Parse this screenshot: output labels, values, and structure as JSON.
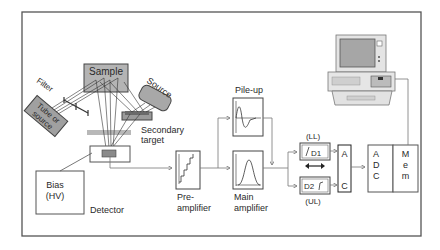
{
  "diagram": {
    "labels": {
      "sample": "Sample",
      "source": "Source",
      "filter": "Filter",
      "tube_line1": "Tube or",
      "tube_line2": "source",
      "secondary_line1": "Secondary",
      "secondary_line2": "target",
      "bias_line1": "Bias",
      "bias_line2": "(HV)",
      "detector": "Detector",
      "preamp_line1": "Pre-",
      "preamp_line2": "amplifier",
      "pileup": "Pile-up",
      "mainamp_line1": "Main",
      "mainamp_line2": "amplifier",
      "ll": "(LL)",
      "ul": "(UL)",
      "d1": "D1",
      "d2": "D2",
      "ac_a": "A",
      "ac_c": "C",
      "adc_a": "A",
      "adc_d": "D",
      "adc_c": "C",
      "mem_m": "M",
      "mem_e": "e",
      "mem_m2": "m"
    },
    "colors": {
      "frame": "#555555",
      "gray_fill": "#b4b4b4",
      "dark_fill": "#8a8a8a",
      "line": "#777777"
    }
  }
}
